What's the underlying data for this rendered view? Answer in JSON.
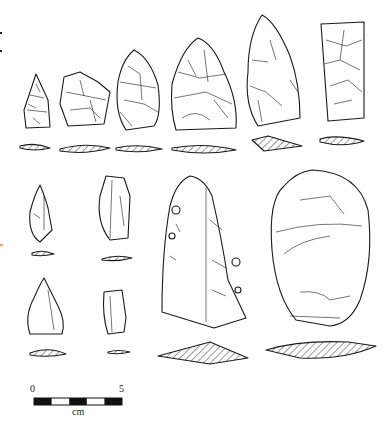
{
  "figure": {
    "type": "lithic-artifact-illustration",
    "background": "#ffffff",
    "ink_color": "#1a1a1a",
    "hatch_color": "#333333"
  },
  "scale_bar": {
    "min_label": "0",
    "max_label": "5",
    "unit_label": "cm",
    "segments": 5
  },
  "edge_marks": [
    {
      "color": "#222222"
    },
    {
      "color": "#222222"
    },
    {
      "color": "#e8a060"
    }
  ],
  "artifacts": {
    "row1": [
      {
        "id": "a1",
        "shape": "triangular-point"
      },
      {
        "id": "a2",
        "shape": "trapezoidal-flake"
      },
      {
        "id": "a3",
        "shape": "ovate-biface"
      },
      {
        "id": "a4",
        "shape": "large-biface"
      },
      {
        "id": "a5",
        "shape": "elongated-biface"
      },
      {
        "id": "a6",
        "shape": "rectangular-blade"
      }
    ],
    "row2": [
      {
        "id": "b1",
        "shape": "small-irregular-flake"
      },
      {
        "id": "b2",
        "shape": "blade-fragment"
      },
      {
        "id": "b3",
        "shape": "large-retouched-blade"
      },
      {
        "id": "b4",
        "shape": "core-or-scraper"
      }
    ],
    "row3": [
      {
        "id": "c1",
        "shape": "triangular-flake"
      },
      {
        "id": "c2",
        "shape": "small-blade-segment"
      }
    ]
  }
}
